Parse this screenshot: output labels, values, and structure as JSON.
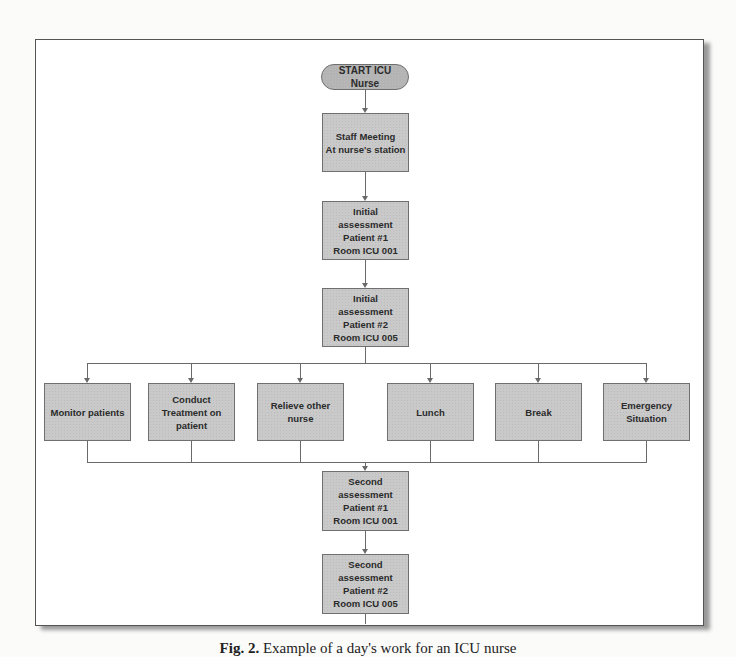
{
  "diagram": {
    "title": "Example of a day's work for an ICU nurse",
    "start": {
      "label": "START ICU Nurse"
    },
    "main_steps": [
      {
        "label": "Staff Meeting\nAt nurse's station"
      },
      {
        "label": "Initial\nassessment\nPatient #1\nRoom ICU 001"
      },
      {
        "label": "Initial\nassessment\nPatient #2\nRoom ICU 005"
      }
    ],
    "branches": [
      {
        "label": "Monitor patients"
      },
      {
        "label": "Conduct\nTreatment on\npatient"
      },
      {
        "label": "Relieve other\nnurse"
      },
      {
        "label": "Lunch"
      },
      {
        "label": "Break"
      },
      {
        "label": "Emergency\nSituation"
      }
    ],
    "after_steps": [
      {
        "label": "Second\nassessment\nPatient #1\nRoom ICU 001"
      },
      {
        "label": "Second\nassessment\nPatient #2\nRoom ICU 005"
      }
    ],
    "colors": {
      "node_fill": "#c9c9c9",
      "node_border": "#6f6f6f",
      "connector": "#6a6a6a",
      "frame_border": "#555555"
    }
  },
  "caption": {
    "figure_label": "Fig. 2.",
    "text": "Example of a day's work for an ICU nurse"
  }
}
